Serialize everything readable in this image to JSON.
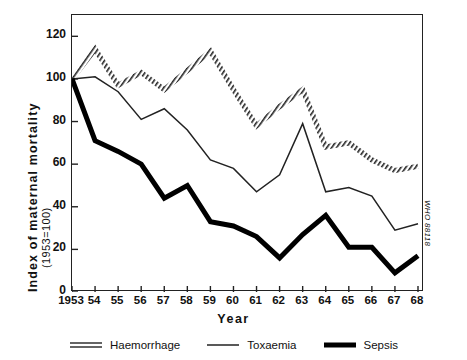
{
  "chart_data": {
    "type": "line",
    "title": "",
    "xlabel": "Year",
    "ylabel": "Index of maternal mortality",
    "ylabel_sub": "(1953=100)",
    "x": [
      1953,
      1954,
      1955,
      1956,
      1957,
      1958,
      1959,
      1960,
      1961,
      1962,
      1963,
      1964,
      1965,
      1966,
      1967,
      1968
    ],
    "categories": [
      "1953",
      "54",
      "55",
      "56",
      "57",
      "58",
      "59",
      "60",
      "61",
      "62",
      "63",
      "64",
      "65",
      "66",
      "67",
      "68"
    ],
    "ylim": [
      0,
      130
    ],
    "yticks": [
      0,
      20,
      40,
      60,
      80,
      100,
      120
    ],
    "ytick_labels": [
      "0",
      "20",
      "40",
      "60",
      "80",
      "100",
      "120"
    ],
    "grid": false,
    "legend_position": "bottom",
    "series": [
      {
        "name": "Haemorrhage",
        "style": "double-hatched",
        "color": "#222222",
        "values": [
          100,
          114,
          97,
          103,
          95,
          104,
          113,
          95,
          78,
          87,
          95,
          68,
          70,
          62,
          57,
          59
        ]
      },
      {
        "name": "Toxaemia",
        "style": "thin",
        "color": "#222222",
        "values": [
          100,
          101,
          94,
          81,
          86,
          76,
          62,
          58,
          47,
          55,
          79,
          47,
          49,
          45,
          29,
          32
        ]
      },
      {
        "name": "Sepsis",
        "style": "thick",
        "color": "#000000",
        "values": [
          100,
          71,
          66,
          60,
          44,
          50,
          33,
          31,
          26,
          16,
          27,
          36,
          21,
          21,
          9,
          17
        ]
      }
    ]
  },
  "side_code": "WHO 88118",
  "legend": {
    "items": [
      {
        "label": "Haemorrhage",
        "swatch": "double-line-swatch"
      },
      {
        "label": "Toxaemia",
        "swatch": "thin-line-swatch"
      },
      {
        "label": "Sepsis",
        "swatch": "thick-line-swatch"
      }
    ]
  }
}
